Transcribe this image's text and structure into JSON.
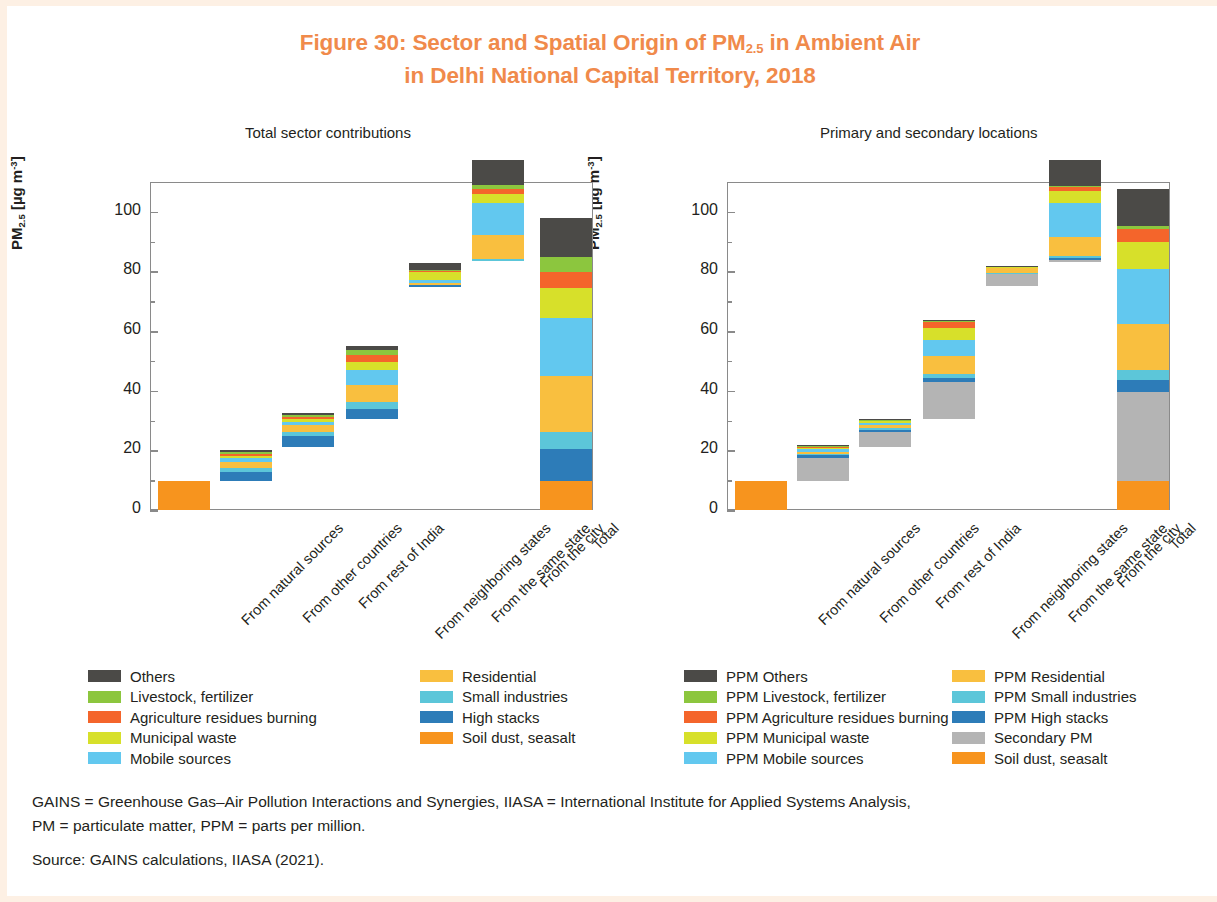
{
  "figure": {
    "title_line1_pre": "Figure 30: Sector and Spatial Origin of PM",
    "title_sub": "2.5",
    "title_line1_post": " in Ambient Air",
    "title_line2": "in Delhi National Capital Territory, 2018",
    "title_color": "#f08a4b"
  },
  "notes": {
    "line1": "GAINS = Greenhouse Gas–Air Pollution Interactions and Synergies, IIASA = International Institute for Applied Systems Analysis,",
    "line2": "PM = particulate matter, PPM = parts per million.",
    "source": "Source: GAINS calculations, IIASA (2021)."
  },
  "axis": {
    "y_label_main": "PM",
    "y_label_sub": "2.5",
    "y_label_unit_open": " [µg m",
    "y_label_unit_sup": "-3",
    "y_label_unit_close": "]",
    "y_ticks": [
      "0",
      "20",
      "40",
      "60",
      "80",
      "100"
    ],
    "y_min": 0,
    "y_max": 110,
    "categories": [
      "From natural sources",
      "From other countries",
      "From rest of India",
      "From neighboring states",
      "From the same state",
      "From the city",
      "Total"
    ]
  },
  "colors": {
    "others": "#4b4a47",
    "livestock_fertilizer": "#8cc63e",
    "agriculture_residues_burning": "#f4652b",
    "municipal_waste": "#d7e02a",
    "mobile_sources": "#62c8ef",
    "residential": "#f9bf3f",
    "small_industries": "#5cc6d9",
    "high_stacks": "#2d7cb8",
    "soil_dust_seasalt": "#f7941e",
    "secondary_pm": "#b4b4b4"
  },
  "chart_data": [
    {
      "type": "bar",
      "subplot": "left",
      "title": "Total sector contributions",
      "stacked": true,
      "waterfall": true,
      "xlabel": "",
      "ylabel": "PM2.5 [µg m-3]",
      "ylim": [
        0,
        110
      ],
      "grid": false,
      "legend_position": "below",
      "categories": [
        "From natural sources",
        "From other countries",
        "From rest of India",
        "From neighboring states",
        "From the same state",
        "From the city",
        "Total"
      ],
      "series": [
        {
          "name": "Soil dust, seasalt",
          "color": "#f7941e",
          "values": [
            9.8,
            0,
            0,
            0,
            0,
            0,
            9.8
          ]
        },
        {
          "name": "High stacks",
          "color": "#2d7cb8",
          "values": [
            0,
            3.0,
            3.6,
            3.4,
            0.4,
            0.2,
            10.6
          ]
        },
        {
          "name": "Small industries",
          "color": "#5cc6d9",
          "values": [
            0,
            1.2,
            1.4,
            2.2,
            0.3,
            0.5,
            5.6
          ]
        },
        {
          "name": "Residential",
          "color": "#f9bf3f",
          "values": [
            0,
            2.1,
            2.4,
            5.8,
            0.5,
            8.0,
            18.8
          ]
        },
        {
          "name": "Mobile sources",
          "color": "#62c8ef",
          "values": [
            0,
            1.4,
            1.1,
            4.9,
            1.2,
            11.0,
            19.6
          ]
        },
        {
          "name": "Municipal waste",
          "color": "#d7e02a",
          "values": [
            0,
            0.7,
            0.9,
            2.9,
            2.6,
            2.8,
            9.9
          ]
        },
        {
          "name": "Agriculture residues burning",
          "color": "#f4652b",
          "values": [
            0,
            0.6,
            0.7,
            2.3,
            0.2,
            1.7,
            5.5
          ]
        },
        {
          "name": "Livestock, fertilizer",
          "color": "#8cc63e",
          "values": [
            0,
            0.8,
            0.6,
            1.8,
            0.4,
            1.3,
            4.9
          ]
        },
        {
          "name": "Others",
          "color": "#4b4a47",
          "values": [
            0,
            0.5,
            0.6,
            1.3,
            2.2,
            8.5,
            13.1
          ]
        }
      ],
      "baselines": [
        0,
        9.8,
        21.1,
        30.5,
        74.9,
        83.4,
        0
      ],
      "bar_tops": [
        9.8,
        21.1,
        30.5,
        75.1,
        83.2,
        107.6,
        107.6
      ]
    },
    {
      "type": "bar",
      "subplot": "right",
      "title": "Primary and secondary locations",
      "stacked": true,
      "waterfall": true,
      "xlabel": "",
      "ylabel": "PM2.5 [µg m-3]",
      "ylim": [
        0,
        110
      ],
      "grid": false,
      "legend_position": "below",
      "categories": [
        "From natural sources",
        "From other countries",
        "From rest of India",
        "From neighboring states",
        "From the same state",
        "From the city",
        "Total"
      ],
      "series": [
        {
          "name": "Soil dust, seasalt",
          "color": "#f7941e",
          "values": [
            9.8,
            0,
            0,
            0,
            0,
            0,
            9.8
          ]
        },
        {
          "name": "Secondary PM",
          "color": "#b4b4b4",
          "values": [
            0,
            7.8,
            5.0,
            12.2,
            4.0,
            0.8,
            29.8
          ]
        },
        {
          "name": "PPM High stacks",
          "color": "#2d7cb8",
          "values": [
            0,
            0.7,
            0.9,
            1.6,
            0.2,
            0.6,
            4.0
          ]
        },
        {
          "name": "PPM Small industries",
          "color": "#5cc6d9",
          "values": [
            0,
            0.5,
            0.6,
            1.2,
            0.2,
            0.7,
            3.2
          ]
        },
        {
          "name": "PPM Residential",
          "color": "#f9bf3f",
          "values": [
            0,
            0.8,
            0.9,
            6.0,
            1.6,
            6.3,
            15.6
          ]
        },
        {
          "name": "PPM Mobile sources",
          "color": "#62c8ef",
          "values": [
            0,
            0.7,
            0.6,
            5.4,
            0.3,
            11.4,
            18.4
          ]
        },
        {
          "name": "PPM Municipal waste",
          "color": "#d7e02a",
          "values": [
            0,
            0.4,
            0.6,
            4.0,
            0.1,
            4.0,
            9.1
          ]
        },
        {
          "name": "PPM Agriculture residues burning",
          "color": "#f4652b",
          "values": [
            0,
            0.5,
            0.3,
            2.0,
            0.1,
            1.4,
            4.3
          ]
        },
        {
          "name": "PPM Livestock, fertilizer",
          "color": "#8cc63e",
          "values": [
            0,
            0.2,
            0.2,
            0.4,
            0.1,
            0.3,
            1.2
          ]
        },
        {
          "name": "PPM Others",
          "color": "#4b4a47",
          "values": [
            0,
            0.3,
            0.3,
            0.4,
            0.2,
            8.7,
            12.1
          ]
        }
      ],
      "baselines": [
        0,
        9.8,
        21.1,
        30.6,
        75.0,
        83.2,
        0
      ],
      "bar_tops": [
        9.8,
        21.4,
        30.5,
        75.0,
        83.0,
        107.4,
        107.4
      ]
    }
  ],
  "legends": {
    "left_column_a": [
      {
        "label": "Others",
        "color": "#4b4a47"
      },
      {
        "label": "Livestock, fertilizer",
        "color": "#8cc63e"
      },
      {
        "label": "Agriculture residues burning",
        "color": "#f4652b"
      },
      {
        "label": "Municipal waste",
        "color": "#d7e02a"
      },
      {
        "label": "Mobile sources",
        "color": "#62c8ef"
      }
    ],
    "left_column_b": [
      {
        "label": "Residential",
        "color": "#f9bf3f"
      },
      {
        "label": "Small industries",
        "color": "#5cc6d9"
      },
      {
        "label": "High stacks",
        "color": "#2d7cb8"
      },
      {
        "label": "Soil dust, seasalt",
        "color": "#f7941e"
      }
    ],
    "right_column_a": [
      {
        "label": "PPM Others",
        "color": "#4b4a47"
      },
      {
        "label": "PPM Livestock, fertilizer",
        "color": "#8cc63e"
      },
      {
        "label": "PPM Agriculture residues burning",
        "color": "#f4652b"
      },
      {
        "label": "PPM Municipal waste",
        "color": "#d7e02a"
      },
      {
        "label": "PPM Mobile sources",
        "color": "#62c8ef"
      }
    ],
    "right_column_b": [
      {
        "label": "PPM Residential",
        "color": "#f9bf3f"
      },
      {
        "label": "PPM Small industries",
        "color": "#5cc6d9"
      },
      {
        "label": "PPM High stacks",
        "color": "#2d7cb8"
      },
      {
        "label": "Secondary PM",
        "color": "#b4b4b4"
      },
      {
        "label": "Soil dust, seasalt",
        "color": "#f7941e"
      }
    ]
  }
}
